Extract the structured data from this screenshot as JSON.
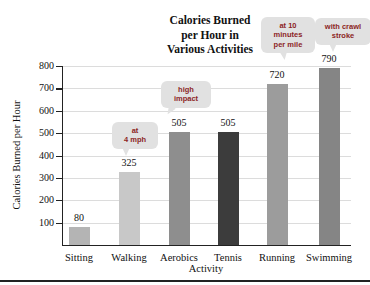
{
  "title": {
    "lines": [
      "Calories Burned",
      "per Hour in",
      "Various Activities"
    ]
  },
  "chart_data": {
    "type": "bar",
    "title": "Calories Burned per Hour in Various Activities",
    "xlabel": "Activity",
    "ylabel": "Calories Burned per Hour",
    "categories": [
      "Sitting",
      "Walking",
      "Aerobics",
      "Tennis",
      "Running",
      "Swimming"
    ],
    "values": [
      80,
      325,
      505,
      505,
      720,
      790
    ],
    "bar_colors": [
      "#b4b4b4",
      "#c8c8c8",
      "#8e8e8e",
      "#3c3c3c",
      "#9c9c9c",
      "#858585"
    ],
    "ylim": [
      0,
      800
    ],
    "yticks": [
      100,
      200,
      300,
      400,
      500,
      600,
      700,
      800
    ],
    "grid": true,
    "legend": "none",
    "annotations": [
      {
        "target": "Walking",
        "lines": [
          "at",
          "4 mph"
        ]
      },
      {
        "target": "Aerobics",
        "lines": [
          "high",
          "impact"
        ]
      },
      {
        "target": "Running",
        "lines": [
          "at 10",
          "minutes",
          "per mile"
        ]
      },
      {
        "target": "Swimming",
        "lines": [
          "with crawl",
          "stroke"
        ]
      }
    ]
  },
  "colors": {
    "annotation_text": "#8c1f1f",
    "annotation_bubble": "#e1e1e1",
    "gridline": "#dcdcdc",
    "axis": "#222222",
    "background": "#ffffff"
  }
}
